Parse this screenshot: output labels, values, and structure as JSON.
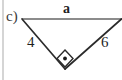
{
  "figure": {
    "part_label": "c)",
    "type": "right-triangle-diagram",
    "background_color": "#ffffff",
    "margin_rule": {
      "name": "left-margin-line",
      "color": "#b9b9b9",
      "x": 3,
      "y_start": 0,
      "y_end": 80
    },
    "vertices": {
      "top_left": {
        "x": 22,
        "y": 19
      },
      "top_right": {
        "x": 121,
        "y": 19
      },
      "bottom": {
        "x": 65,
        "y": 69
      }
    },
    "sides": [
      {
        "name": "top-side",
        "label": "a",
        "from": "top_left",
        "to": "top_right",
        "color": "#8c8c8c",
        "stroke_width": 2,
        "known": false
      },
      {
        "name": "left-side",
        "label": "4",
        "from": "top_left",
        "to": "bottom",
        "color": "#2b2b2b",
        "stroke_width": 1.6,
        "known": true,
        "value": 4
      },
      {
        "name": "right-side",
        "label": "6",
        "from": "top_right",
        "to": "bottom",
        "color": "#2b2b2b",
        "stroke_width": 1.6,
        "known": true,
        "value": 6
      }
    ],
    "right_angle_marker": {
      "name": "right-angle-marker",
      "shape": "diamond-with-dot",
      "at_vertex": "bottom",
      "center": {
        "x": 65,
        "y": 58
      },
      "half_size": 8,
      "stroke_color": "#2b2b2b",
      "dot_color": "#1a1a1a",
      "dot_radius": 1.8
    }
  }
}
